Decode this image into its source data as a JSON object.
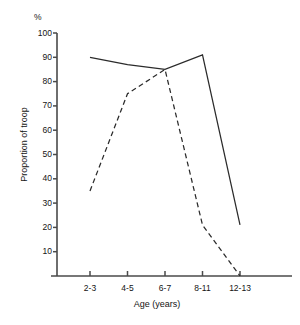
{
  "chart_data": {
    "type": "line",
    "title": "",
    "xlabel": "Age (years)",
    "ylabel": "Proportion of troop",
    "unit_label": "%",
    "categories": [
      "2-3",
      "4-5",
      "6-7",
      "8-11",
      "12-13"
    ],
    "ylim": [
      0,
      100
    ],
    "yticks": [
      100,
      90,
      80,
      70,
      60,
      50,
      40,
      30,
      20,
      10
    ],
    "grid": false,
    "legend": "none",
    "series": [
      {
        "name": "solid-series",
        "style": "solid",
        "color": "#2b2b2b",
        "values": [
          90,
          87,
          85,
          91,
          21
        ]
      },
      {
        "name": "dashed-series",
        "style": "dashed",
        "color": "#2b2b2b",
        "values": [
          35,
          75,
          85,
          21,
          0
        ]
      }
    ]
  },
  "axis": {
    "color": "#4a4a4a",
    "origin_x": 57,
    "origin_y": 276,
    "top_y": 33,
    "right_x": 292,
    "px_per_unit": 2.43,
    "category_start_x": 90,
    "category_step_x": 37.5
  }
}
